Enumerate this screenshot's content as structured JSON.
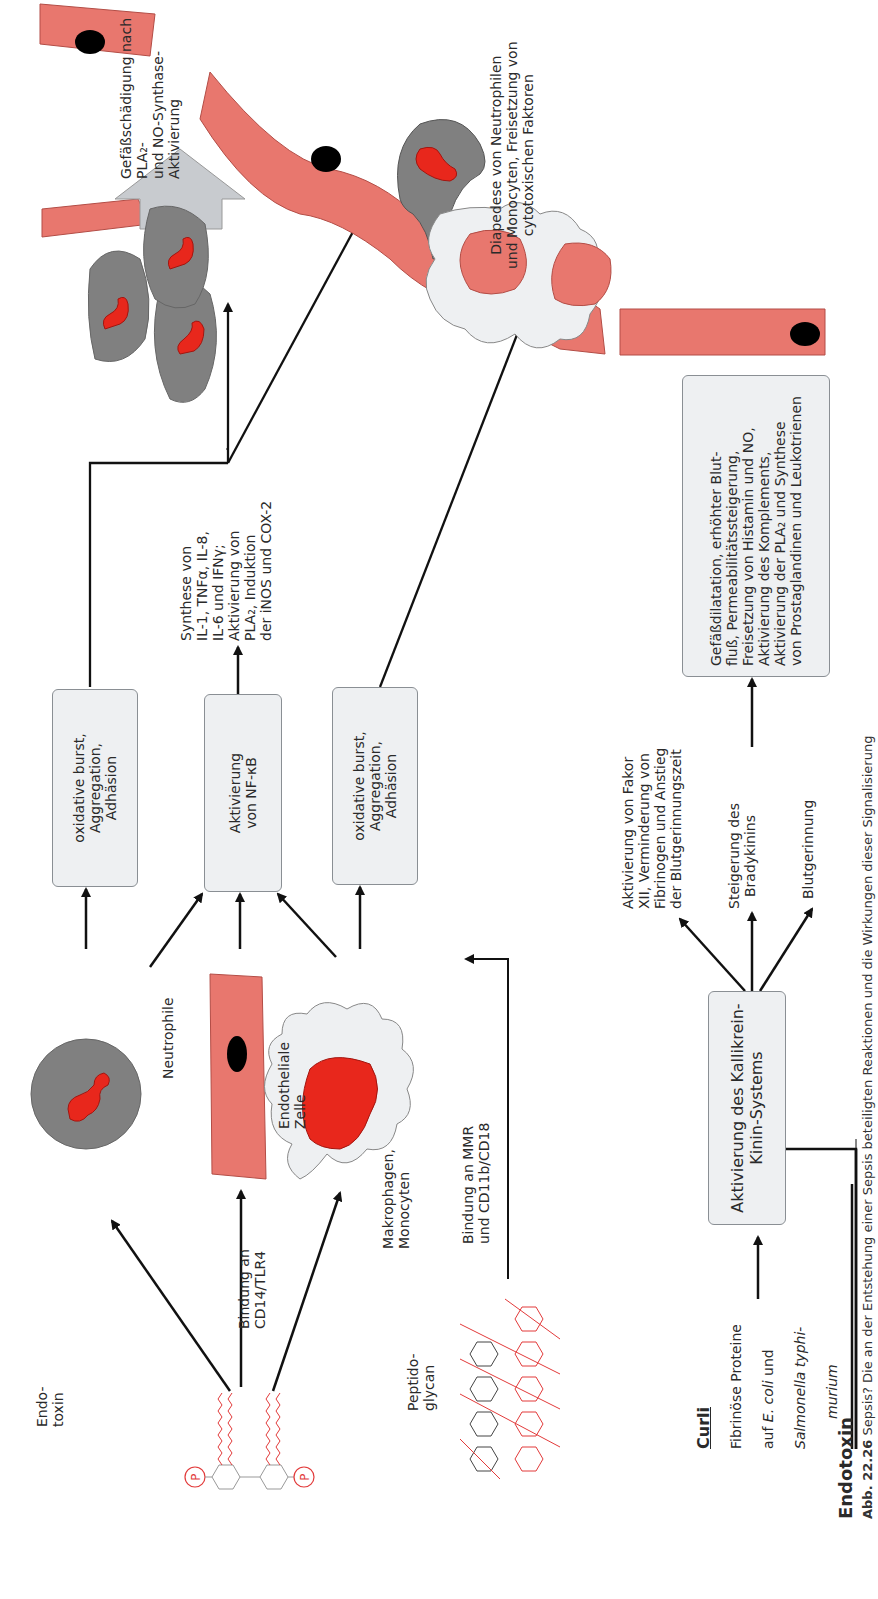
{
  "figure": {
    "orientation": "rotated-90-ccw",
    "colors": {
      "cell_red": "#e8776e",
      "nucleus_red": "#e8271c",
      "neutrophil_gray": "#7f7f7f",
      "box_fill": "#eef0f2",
      "arrow_gray": "#c8cbcf",
      "lps_red": "#e23a3a"
    }
  },
  "sources": {
    "endotoxin": {
      "label": "Endo-\ntoxin"
    },
    "peptidoglycan": {
      "label": "Peptido-\nglycan"
    },
    "curli": {
      "title": "Curli",
      "line1": "Fibrinöse Proteine",
      "line2_pre": "auf ",
      "line2_italic": "E. coli",
      "line2_post": " und",
      "line3_italic": "Salmonella typhi-",
      "line4_italic": "murium"
    },
    "endotoxin_bottom": {
      "label": "Endotoxin"
    }
  },
  "binding": {
    "cd14": "Bindung an\nCD14/TLR4",
    "mmr": "Bindung an MMR\nund CD11b/CD18"
  },
  "cells": {
    "neutrophile": "Neutrophile",
    "endothelial": "Endotheliale\nZelle",
    "makrophagen": "Makrophagen,\nMonocyten"
  },
  "boxes": {
    "neutro_burst": "oxidative burst,\nAggregation,\nAdhäsion",
    "nfkb": "Aktivierung\nvon NF-κB",
    "makro_burst": "oxidative burst,\nAggregation,\nAdhäsion",
    "kallikrein": "Aktivierung des Kallikrein-\nKinin-Systems",
    "gefaess": "Gefäßdilatation, erhöhter Blut-\nfluß, Permeabilitätssteigerung,\nFreisetzung von Histamin und NO,\nAktivierung des Komplements,\nAktivierung der PLA₂ und Synthese\nvon Prostaglandinen und Leukotrienen"
  },
  "effects": {
    "cytokines": "Synthese von\nIL-1, TNFα, IL-8,\nIL-6 und IFNγ;\nAktivierung von\nPLA₂, Induktion\nder iNOS und COX-2",
    "gefaessschaedigung": "Gefäßschädigung nach PLA₂-\nund NO-Synthase-Aktivierung",
    "diapedese": "Diapedese von Neutrophilen\nund Monocyten, Freisetzung von\ncytotoxischen  Faktoren",
    "faktor_xii": "Aktivierung von Fakor\nXII, Verminderung von\nFibrinogen und Anstieg\nder Blutgerinnungszeit",
    "bradykinin": "Steigerung des\nBradykinins",
    "blutgerinnung": "Blutgerinnung"
  },
  "caption": {
    "number": "Abb. 22.26",
    "text": "Sepsis? Die an der Entstehung einer Sepsis beteiligten Reaktionen und die Wirkungen dieser Signalisierung"
  }
}
